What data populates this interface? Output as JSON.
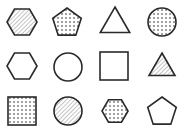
{
  "colors": {
    "background": "#ffffff",
    "stroke": "#2a2a2a",
    "hatch": "#9a9a9a",
    "dot": "#2a2a2a"
  },
  "grid": {
    "rows": 3,
    "cols": 4
  },
  "shapes": [
    {
      "row": 1,
      "col": 1,
      "type": "hexagon",
      "fill": "hatched",
      "cx": 22,
      "cy": 22,
      "r": 15
    },
    {
      "row": 1,
      "col": 2,
      "type": "pentagon",
      "fill": "dotted",
      "cx": 67,
      "cy": 23,
      "r": 15
    },
    {
      "row": 1,
      "col": 3,
      "type": "triangle",
      "fill": "none",
      "cx": 115,
      "cy": 24,
      "r": 17
    },
    {
      "row": 1,
      "col": 4,
      "type": "circle",
      "fill": "dotted",
      "cx": 162,
      "cy": 22,
      "r": 14
    },
    {
      "row": 2,
      "col": 1,
      "type": "hexagon",
      "fill": "none",
      "cx": 22,
      "cy": 66,
      "r": 15
    },
    {
      "row": 2,
      "col": 2,
      "type": "circle",
      "fill": "none",
      "cx": 68,
      "cy": 67,
      "r": 14
    },
    {
      "row": 2,
      "col": 3,
      "type": "square",
      "fill": "none",
      "cx": 114,
      "cy": 66,
      "r": 14
    },
    {
      "row": 2,
      "col": 4,
      "type": "triangle",
      "fill": "hatched",
      "cx": 162,
      "cy": 68,
      "r": 15
    },
    {
      "row": 3,
      "col": 1,
      "type": "square",
      "fill": "dotted",
      "cx": 22,
      "cy": 111,
      "r": 14
    },
    {
      "row": 3,
      "col": 2,
      "type": "circle",
      "fill": "hatched",
      "cx": 68,
      "cy": 111,
      "r": 14
    },
    {
      "row": 3,
      "col": 3,
      "type": "hexagon",
      "fill": "dotted",
      "cx": 115,
      "cy": 111,
      "r": 13
    },
    {
      "row": 3,
      "col": 4,
      "type": "pentagon",
      "fill": "none",
      "cx": 162,
      "cy": 112,
      "r": 15
    }
  ]
}
